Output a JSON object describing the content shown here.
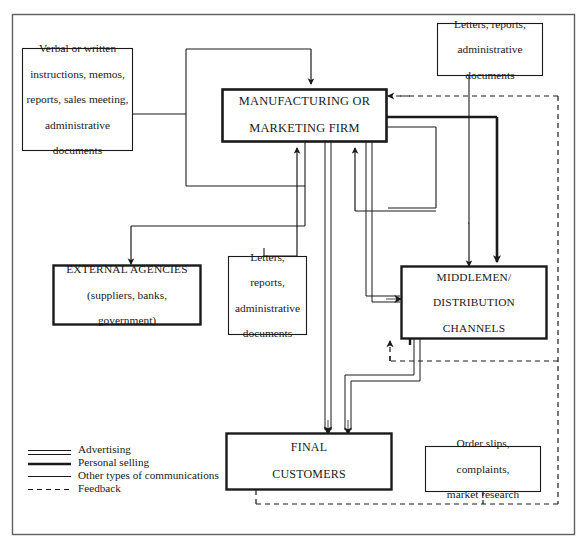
{
  "diagram": {
    "frame": {
      "stroke": "#555555"
    },
    "colors": {
      "line": "#1a1a1a",
      "box_border": "#1a1a1a",
      "frame": "#606060",
      "background": "#ffffff"
    },
    "boxes": [
      {
        "id": "verbal-instructions",
        "lines": [
          "Verbal or written",
          "instructions, memos,",
          "reports, sales meeting,",
          "administrative",
          "documents"
        ],
        "style": "thin",
        "case": "mixed"
      },
      {
        "id": "manufacturing-firm",
        "lines": [
          "MANUFACTURING OR",
          "MARKETING FIRM"
        ],
        "style": "thick",
        "case": "upper"
      },
      {
        "id": "letters-reports-top",
        "lines": [
          "Letters, reports,",
          "administrative",
          "documents"
        ],
        "style": "thin",
        "case": "mixed"
      },
      {
        "id": "external-agencies",
        "lines": [
          "EXTERNAL AGENCIES",
          "(suppliers, banks,",
          "government)"
        ],
        "style": "thick",
        "case": "mixed"
      },
      {
        "id": "letters-reports-mid",
        "lines": [
          "Letters,",
          "reports,",
          "administrative",
          "documents"
        ],
        "style": "thin",
        "case": "mixed"
      },
      {
        "id": "middlemen",
        "lines": [
          "MIDDLEMEN/",
          "DISTRIBUTION",
          "CHANNELS"
        ],
        "style": "thick",
        "case": "upper"
      },
      {
        "id": "final-customers",
        "lines": [
          "FINAL",
          "CUSTOMERS"
        ],
        "style": "thick",
        "case": "upper"
      },
      {
        "id": "order-slips",
        "lines": [
          "Order slips,",
          "complaints,",
          "market research"
        ],
        "style": "thin",
        "case": "mixed"
      }
    ],
    "legend": {
      "items": [
        {
          "label": "Advertising",
          "line_style": "double"
        },
        {
          "label": "Personal selling",
          "line_style": "thick"
        },
        {
          "label": "Other types of communications",
          "line_style": "thin"
        },
        {
          "label": "Feedback",
          "line_style": "dashed"
        }
      ]
    }
  }
}
